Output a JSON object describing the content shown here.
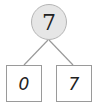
{
  "diagram": {
    "type": "number-bond",
    "whole": "7",
    "parts": [
      "0",
      "7"
    ],
    "colors": {
      "circle_fill": "#e6e6e6",
      "line": "#9a9a9a",
      "box_border": "#9a9a9a"
    }
  }
}
